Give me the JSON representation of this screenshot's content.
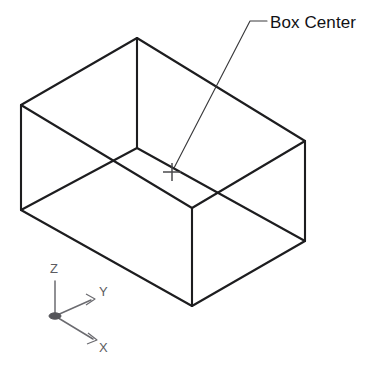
{
  "figure": {
    "title": "Box Center",
    "background_color": "#ffffff",
    "line_color": "#1d1d1f",
    "leader_color": "#3a3a3c",
    "axis_color": "#6b6b70",
    "text_color": "#111114"
  },
  "callout": {
    "label": "Box Center",
    "text_x": 270,
    "text_y": 28,
    "leader_path": "M 267 21 L 250 21 L 174 168",
    "marker": {
      "name": "center-cross-marker",
      "x": 172,
      "y": 172,
      "arm": 9
    }
  },
  "box": {
    "name": "isometric-box",
    "vertices": {
      "top_back": {
        "x": 137,
        "y": 38
      },
      "top_left": {
        "x": 21,
        "y": 105
      },
      "top_right": {
        "x": 305,
        "y": 141
      },
      "top_front": {
        "x": 192,
        "y": 208
      },
      "mid_inner": {
        "x": 137,
        "y": 148
      },
      "bot_left": {
        "x": 21,
        "y": 210
      },
      "bot_right": {
        "x": 305,
        "y": 241
      },
      "bot_front": {
        "x": 192,
        "y": 306
      }
    },
    "edges": [
      {
        "name": "top-face-back-left",
        "d": "M 137 38 L 21 105"
      },
      {
        "name": "top-face-back-right",
        "d": "M 137 38 L 305 141"
      },
      {
        "name": "top-face-front-left",
        "d": "M 21 105 L 192 208"
      },
      {
        "name": "top-face-front-right",
        "d": "M 192 208 L 305 141"
      },
      {
        "name": "inner-vertical-edge",
        "d": "M 137 38 L 137 148"
      },
      {
        "name": "inner-diagonal-left",
        "d": "M 137 148 L 21 210"
      },
      {
        "name": "inner-diagonal-right",
        "d": "M 137 148 L 305 241"
      },
      {
        "name": "vertical-edge-left",
        "d": "M 21 105 L 21 210"
      },
      {
        "name": "vertical-edge-front",
        "d": "M 192 208 L 192 306"
      },
      {
        "name": "vertical-edge-right",
        "d": "M 305 141 L 305 241"
      },
      {
        "name": "bottom-edge-left",
        "d": "M 21 210 L 192 306"
      },
      {
        "name": "bottom-edge-right",
        "d": "M 192 306 L 305 241"
      }
    ]
  },
  "ucs_icon": {
    "name": "ucs-axis-indicator",
    "origin": {
      "x": 55,
      "y": 316
    },
    "axes": [
      {
        "name": "z-axis",
        "label": "Z",
        "line": "M 55 316 L 55 281",
        "label_x": 50,
        "label_y": 273,
        "arrow": null
      },
      {
        "name": "y-axis",
        "label": "Y",
        "line": "M 55 316 L 91 300",
        "label_x": 99,
        "label_y": 296,
        "arrow": "M 86 294 L 95 299 L 86 305"
      },
      {
        "name": "x-axis",
        "label": "X",
        "line": "M 55 316 L 93 339",
        "label_x": 99,
        "label_y": 352,
        "arrow": "M 88 333 L 97 340 L 87 344"
      }
    ]
  }
}
